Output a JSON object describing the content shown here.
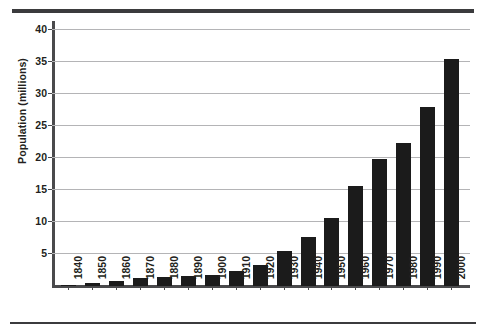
{
  "chart_data": {
    "type": "bar",
    "title": "",
    "xlabel": "",
    "ylabel": "Population (millions)",
    "categories": [
      "1840",
      "1850",
      "1860",
      "1870",
      "1880",
      "1890",
      "1900",
      "1910",
      "1920",
      "1930",
      "1940",
      "1950",
      "1960",
      "1970",
      "1980",
      "1990",
      "2000"
    ],
    "values": [
      0.2,
      0.5,
      0.8,
      1.2,
      1.4,
      1.6,
      1.8,
      2.3,
      3.3,
      5.5,
      7.6,
      10.6,
      15.7,
      19.8,
      22.4,
      28.0,
      35.6
    ],
    "ylim": [
      0,
      41
    ],
    "yticks": [
      5,
      10,
      15,
      20,
      25,
      30,
      35,
      40
    ],
    "ytick_labels": [
      "5",
      "10",
      "15",
      "20",
      "25",
      "30",
      "35",
      "40"
    ],
    "grid": true,
    "legend": "none",
    "bar_color": "#1b1b1b",
    "grid_color": "#b4b4b6",
    "axis_color": "#4a4a4c"
  },
  "figure": {
    "rule_top": "",
    "rule_bottom": ""
  }
}
